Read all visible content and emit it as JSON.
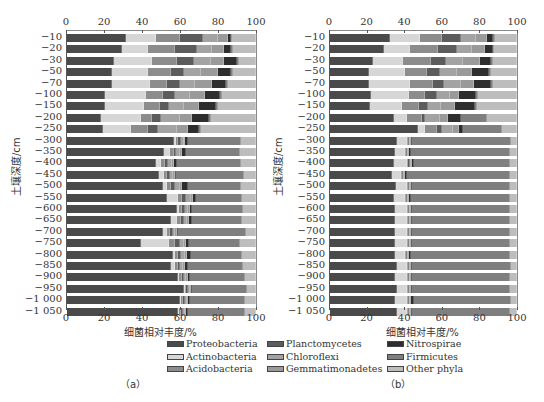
{
  "colors": {
    "Proteobacteria": "#4a4a4a",
    "Actinobacteria": "#d6d6d6",
    "Acidobacteria": "#8c8c8c",
    "Planctomycetes": "#5c5c5c",
    "Chloroflexi": "#a3a3a3",
    "Gemmatimonadetes": "#9a9a9a",
    "Nitrospirae": "#2e2e2e",
    "Firmicutes": "#7f7f7f",
    "Other phyla": "#bdbdbd"
  },
  "legend": {
    "items": [
      {
        "label": "Proteobacteria",
        "col": 0,
        "row": 0
      },
      {
        "label": "Actinobacteria",
        "col": 0,
        "row": 1
      },
      {
        "label": "Acidobacteria",
        "col": 0,
        "row": 2
      },
      {
        "label": "Planctomycetes",
        "col": 1,
        "row": 0
      },
      {
        "label": "Chloroflexi",
        "col": 1,
        "row": 1
      },
      {
        "label": "Gemmatimonadetes",
        "col": 1,
        "row": 2
      },
      {
        "label": "Nitrospirae",
        "col": 2,
        "row": 0
      },
      {
        "label": "Firmicutes",
        "col": 2,
        "row": 1
      },
      {
        "label": "Other phyla",
        "col": 2,
        "row": 2
      }
    ]
  },
  "captions": {
    "a": "（a）",
    "b": "（b）"
  },
  "axis": {
    "x_title": "细菌相对丰度/%",
    "y_title": "土壤深度/cm",
    "x_ticks": [
      "0",
      "20",
      "40",
      "60",
      "80",
      "100"
    ],
    "y_ticks": [
      "−10",
      "−20",
      "−30",
      "−50",
      "−70",
      "−100",
      "−150",
      "−200",
      "−250",
      "−300",
      "−350",
      "−400",
      "−450",
      "−500",
      "−550",
      "−600",
      "−650",
      "−700",
      "−750",
      "−800",
      "−850",
      "−900",
      "−950",
      "−1 000",
      "−1 050"
    ]
  },
  "chart_data": [
    {
      "type": "bar",
      "orientation": "horizontal",
      "stacked": true,
      "title": "(a)",
      "xlabel": "细菌相对丰度/%",
      "ylabel": "土壤深度/cm",
      "xlim": [
        0,
        100
      ],
      "x_ticks": [
        0,
        20,
        40,
        60,
        80,
        100
      ],
      "x_ticks_position": "top and bottom",
      "categories": [
        "-10",
        "-20",
        "-30",
        "-50",
        "-70",
        "-100",
        "-150",
        "-200",
        "-250",
        "-300",
        "-350",
        "-400",
        "-450",
        "-500",
        "-550",
        "-600",
        "-650",
        "-700",
        "-750",
        "-800",
        "-850",
        "-900",
        "-950",
        "-1000",
        "-1050"
      ],
      "series": [
        {
          "name": "Proteobacteria",
          "values": [
            31,
            29,
            25,
            24,
            24,
            20,
            20,
            18,
            19,
            57,
            52,
            47,
            49,
            51,
            53,
            59,
            55,
            51,
            39,
            56,
            55,
            59,
            62,
            60,
            59
          ]
        },
        {
          "name": "Actinobacteria",
          "values": [
            16,
            14,
            20,
            19,
            20,
            22,
            21,
            21,
            15,
            1,
            3,
            3,
            3,
            2,
            6,
            1,
            3,
            2,
            15,
            1,
            2,
            0.5,
            0.5,
            0.5,
            0.5
          ]
        },
        {
          "name": "Acidobacteria",
          "values": [
            13,
            14,
            13,
            12,
            9,
            9,
            8,
            6,
            9,
            1,
            2,
            2,
            1.5,
            2,
            2,
            1.5,
            2,
            1.5,
            3,
            2,
            1.5,
            1.5,
            1,
            1,
            1
          ]
        },
        {
          "name": "Planctomycetes",
          "values": [
            12,
            12,
            9,
            7,
            7,
            6,
            5,
            5,
            5,
            1.5,
            1.5,
            1.5,
            1.5,
            2,
            2,
            1.5,
            1.5,
            1.5,
            3,
            1.5,
            1.5,
            1,
            1,
            1,
            1
          ]
        },
        {
          "name": "Chloroflexi",
          "values": [
            8,
            8,
            9,
            9,
            8,
            8,
            8,
            10,
            10,
            1.5,
            2,
            2,
            1.5,
            3,
            2.5,
            1.5,
            1.5,
            1,
            2,
            2,
            1.5,
            1.5,
            1,
            1,
            1
          ]
        },
        {
          "name": "Gemmatimonadetes",
          "values": [
            5,
            6,
            7,
            9,
            9,
            8,
            8,
            6,
            6,
            1,
            1,
            1,
            1,
            1,
            1,
            1,
            1,
            1,
            1,
            1,
            1,
            1,
            0.5,
            0.5,
            0.5
          ]
        },
        {
          "name": "Nitrospirae",
          "values": [
            2,
            4,
            7,
            7,
            7,
            8,
            9,
            9,
            6,
            1.5,
            2,
            1.5,
            1,
            3,
            2,
            1.5,
            2,
            1,
            1.5,
            2,
            1.5,
            1,
            0.5,
            1,
            1
          ]
        },
        {
          "name": "Firmicutes",
          "values": [
            0.5,
            1,
            1,
            1,
            1,
            1,
            1,
            1,
            1,
            28,
            29,
            34,
            36,
            28,
            24,
            27,
            26,
            36,
            27,
            27,
            29,
            29,
            29,
            29,
            30
          ]
        },
        {
          "name": "Other phyla",
          "values": [
            12.5,
            12,
            9,
            12,
            15,
            18,
            20,
            24,
            29,
            8,
            8.5,
            8,
            6.5,
            8,
            7.5,
            7,
            7.5,
            5,
            8.5,
            7.5,
            7,
            6,
            5,
            6,
            6
          ]
        }
      ]
    },
    {
      "type": "bar",
      "orientation": "horizontal",
      "stacked": true,
      "title": "(b)",
      "xlabel": "细菌相对丰度/%",
      "ylabel": "土壤深度/cm",
      "xlim": [
        0,
        100
      ],
      "x_ticks": [
        0,
        20,
        40,
        60,
        80,
        100
      ],
      "x_ticks_position": "top and bottom",
      "categories": [
        "-10",
        "-20",
        "-30",
        "-50",
        "-70",
        "-100",
        "-150",
        "-200",
        "-250",
        "-300",
        "-350",
        "-400",
        "-450",
        "-500",
        "-550",
        "-600",
        "-650",
        "-700",
        "-750",
        "-800",
        "-850",
        "-900",
        "-950",
        "-1000",
        "-1050"
      ],
      "series": [
        {
          "name": "Proteobacteria",
          "values": [
            32,
            29,
            23,
            21,
            21,
            22,
            21,
            34,
            47,
            36,
            35,
            34,
            33,
            35,
            34,
            35,
            35,
            35,
            35,
            35,
            36,
            35,
            36,
            35,
            36
          ]
        },
        {
          "name": "Actinobacteria",
          "values": [
            16,
            14,
            16,
            19,
            22,
            20,
            17,
            7,
            4,
            5,
            5,
            7,
            5,
            6,
            6,
            6,
            6,
            6,
            6,
            5,
            5,
            6,
            5,
            6,
            5
          ]
        },
        {
          "name": "Acidobacteria",
          "values": [
            12,
            15,
            15,
            12,
            12,
            9,
            9,
            8,
            6,
            0.5,
            0.5,
            0.5,
            0.5,
            0.5,
            0.5,
            0.5,
            0.5,
            0.5,
            0.5,
            0.5,
            0.5,
            0.5,
            0.5,
            0.5,
            0.5
          ]
        },
        {
          "name": "Planctomycetes",
          "values": [
            10,
            10,
            8,
            7,
            6,
            6,
            5,
            2,
            3,
            0.5,
            0.5,
            1.5,
            0.5,
            0.5,
            0.5,
            0.5,
            0.5,
            0.5,
            0.5,
            0.5,
            0.5,
            0.5,
            0.5,
            0.5,
            0.5
          ]
        },
        {
          "name": "Chloroflexi",
          "values": [
            8,
            8,
            9,
            9,
            9,
            7,
            7,
            8,
            6,
            0.5,
            0.5,
            0.5,
            0.5,
            0.5,
            0.5,
            0.5,
            0.5,
            0.5,
            0.5,
            0.5,
            0.5,
            0.5,
            0.5,
            0.5,
            0.5
          ]
        },
        {
          "name": "Gemmatimonadetes",
          "values": [
            6,
            7,
            9,
            8,
            7,
            5,
            7,
            4,
            3,
            0.5,
            0.5,
            0.5,
            0.5,
            0.5,
            0.5,
            0.5,
            0.5,
            0.5,
            0.5,
            0.5,
            0.5,
            0.5,
            0.5,
            0.5,
            0.5
          ]
        },
        {
          "name": "Nitrospirae",
          "values": [
            3,
            4,
            6,
            9,
            9,
            9,
            11,
            7,
            2,
            1,
            1,
            1,
            1,
            0.5,
            1,
            0.5,
            0.5,
            0.5,
            0.5,
            1.5,
            1,
            0.5,
            0.5,
            2,
            0.5
          ]
        },
        {
          "name": "Firmicutes",
          "values": [
            1,
            1,
            1,
            1,
            1,
            1,
            1,
            14,
            21,
            53,
            53,
            51,
            55,
            52,
            53,
            53,
            53,
            53,
            53,
            53,
            53,
            53,
            53,
            52,
            53
          ]
        },
        {
          "name": "Other phyla",
          "values": [
            12,
            12,
            13,
            14,
            13,
            21,
            21,
            16,
            8,
            3,
            4,
            4,
            4,
            4,
            4,
            3.5,
            3.5,
            3.5,
            3.5,
            3.5,
            3,
            3.5,
            3.5,
            3,
            3.5
          ]
        }
      ]
    }
  ]
}
